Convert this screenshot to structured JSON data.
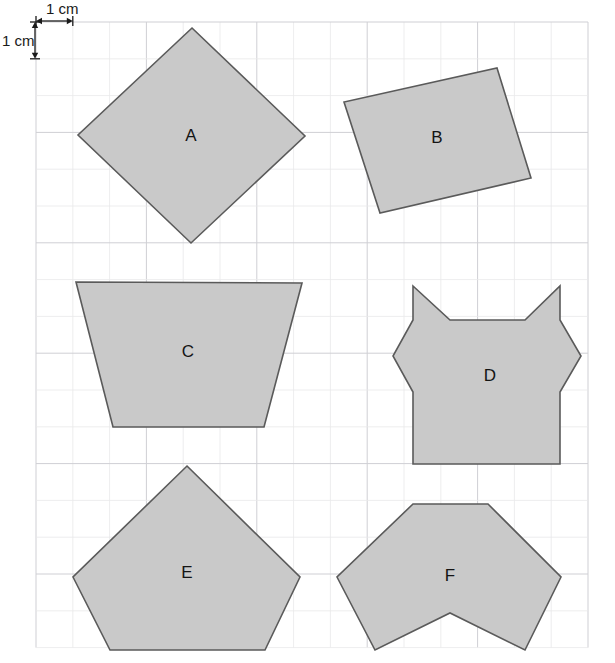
{
  "page": {
    "width": 615,
    "height": 663,
    "background_color": "#ffffff"
  },
  "grid": {
    "origin_x": 36,
    "origin_y": 22,
    "cell_size": 36.8,
    "cols": 15,
    "rows": 17,
    "line_color_minor": "#e8e8ea",
    "line_color_major": "#cfcfd4",
    "major_every": 3
  },
  "scale_annotation": {
    "horizontal_label": "1 cm",
    "vertical_label": "1 cm",
    "horizontal_label_x": 46,
    "horizontal_label_y": 14,
    "vertical_label_x": 2,
    "vertical_label_y": 46,
    "arrow_color": "#1a1a1a"
  },
  "style": {
    "shape_fill": "#c9c9c9",
    "shape_stroke": "#5a5a5a",
    "shape_stroke_width": 1.6,
    "label_color": "#141414"
  },
  "shapes": [
    {
      "id": "shape-a",
      "label": "A",
      "kind": "square-rotated-45",
      "label_x": 191,
      "label_y": 137,
      "points": "192,28 305,136 191,243 78,135"
    },
    {
      "id": "shape-b",
      "label": "B",
      "kind": "tilted-quadrilateral",
      "label_x": 437,
      "label_y": 139,
      "points": "497,68 531,178 380,213 344,102"
    },
    {
      "id": "shape-c",
      "label": "C",
      "kind": "trapezoid",
      "label_x": 188,
      "label_y": 353,
      "points": "76,282 302,283 264,427 113,427"
    },
    {
      "id": "shape-d",
      "label": "D",
      "kind": "notched-octagon",
      "label_x": 490,
      "label_y": 377,
      "points": "413,286 450,320 525,320 560,286 560,320 581,356 560,392 560,464 413,464 413,392 393,356 413,320"
    },
    {
      "id": "shape-e",
      "label": "E",
      "kind": "boat-pentagon",
      "label_x": 187,
      "label_y": 574,
      "points": "187,466 300,577 265,650 110,650 73,577"
    },
    {
      "id": "shape-f",
      "label": "F",
      "kind": "notched-hexagon",
      "label_x": 450,
      "label_y": 577,
      "points": "413,504 488,504 561,577 525,650 450,613 375,650 337,577"
    }
  ]
}
